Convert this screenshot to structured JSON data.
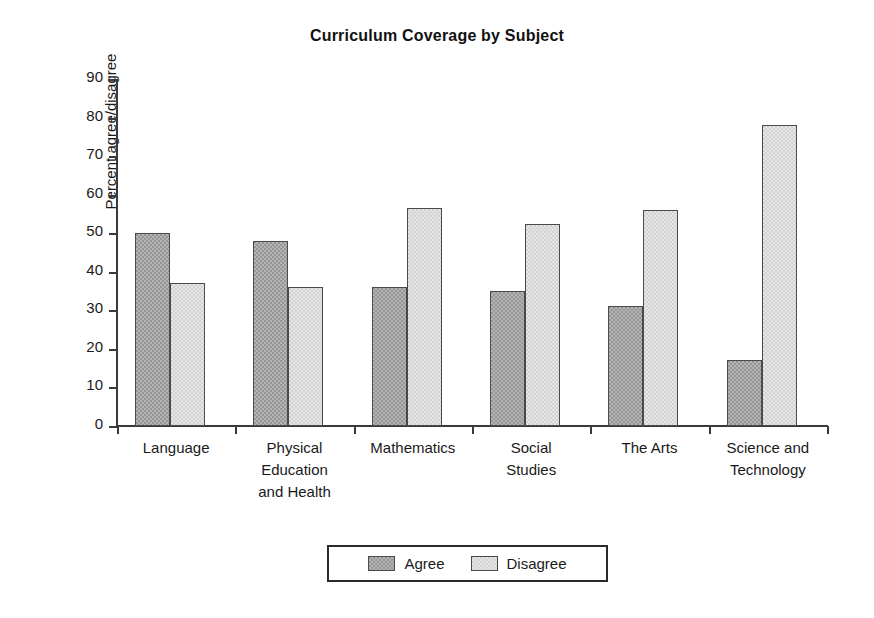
{
  "chart_data": {
    "type": "bar",
    "title": "Curriculum Coverage by Subject",
    "xlabel": "",
    "ylabel": "Percent agree/disagree",
    "ylim": [
      0,
      90
    ],
    "yticks": [
      0,
      10,
      20,
      30,
      40,
      50,
      60,
      70,
      80,
      90
    ],
    "grid": false,
    "legend_position": "bottom",
    "categories": [
      "Language",
      "Physical Education and Health",
      "Mathematics",
      "Social Studies",
      "The Arts",
      "Science and Technology"
    ],
    "category_lines": [
      [
        "Language"
      ],
      [
        "Physical",
        "Education",
        "and Health"
      ],
      [
        "Mathematics"
      ],
      [
        "Social",
        "Studies"
      ],
      [
        "The Arts"
      ],
      [
        "Science and",
        "Technology"
      ]
    ],
    "series": [
      {
        "name": "Agree",
        "color": "#979797",
        "values": [
          50,
          48,
          36,
          35,
          31,
          17
        ]
      },
      {
        "name": "Disagree",
        "color": "#d2d2d2",
        "values": [
          37,
          36,
          56.5,
          52.5,
          56,
          78
        ]
      }
    ]
  },
  "legend": {
    "items": [
      {
        "label": "Agree"
      },
      {
        "label": "Disagree"
      }
    ]
  },
  "colors": {
    "agree": "#979797",
    "disagree": "#d2d2d2",
    "axis": "#3a3a3a",
    "text": "#1a1a1a",
    "background": "#ffffff"
  }
}
